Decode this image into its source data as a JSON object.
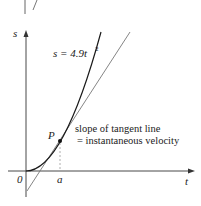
{
  "diagram": {
    "type": "graph",
    "curve_label": "s = 4.9t²",
    "curve_label_main": "s = 4.9t",
    "curve_label_exp": "2",
    "axes": {
      "x_label": "t",
      "y_label": "s",
      "origin_label": "0"
    },
    "point": {
      "label": "P",
      "x_tick_label": "a"
    },
    "annotation": {
      "line1": "slope of tangent line",
      "line2": "= instantaneous velocity"
    },
    "colors": {
      "curve": "#1a1a1a",
      "tangent": "#777777",
      "axis": "#333333",
      "dashed": "#999999"
    }
  }
}
